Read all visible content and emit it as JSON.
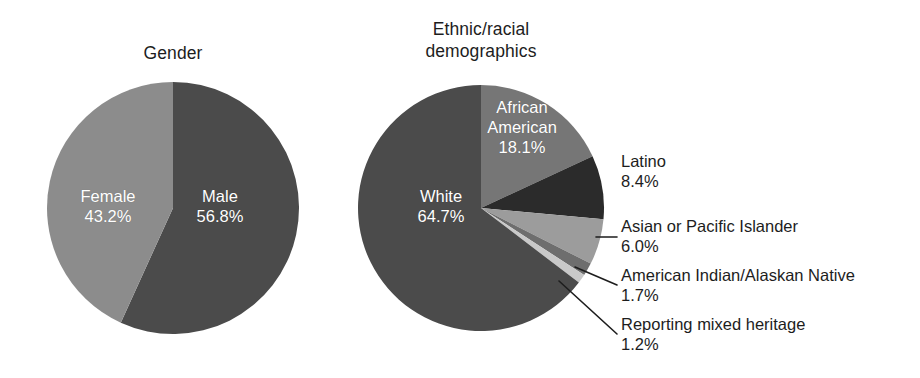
{
  "figure": {
    "background_color": "#ffffff",
    "text_color": "#1d1d1d",
    "inner_label_color": "#ffffff"
  },
  "charts": [
    {
      "id": "gender",
      "title": "Gender",
      "title_lines": "Gender"
    },
    {
      "id": "ethnic",
      "title": "Ethnic/racial demographics",
      "title_lines": "Ethnic/racial\ndemographics"
    }
  ],
  "labels": {
    "female_name": "Female",
    "female_value": "43.2%",
    "male_name": "Male",
    "male_value": "56.8%",
    "white_name": "White",
    "white_value": "64.7%",
    "african_american_name": "African American",
    "african_american_value": "18.1%",
    "latino_name": "Latino",
    "latino_value": "8.4%",
    "asian_name": "Asian or Pacific Islander",
    "asian_value": "6.0%",
    "american_indian_name": "American Indian/Alaskan Native",
    "american_indian_value": "1.7%",
    "mixed_name": "Reporting mixed heritage",
    "mixed_value": "1.2%"
  },
  "chart_data": [
    {
      "type": "pie",
      "title": "Gender",
      "xlabel": "",
      "ylabel": "",
      "legend": "none",
      "labels_position": "inside-slice",
      "start_angle_deg": 0,
      "direction": "clockwise",
      "categories": [
        "Male",
        "Female"
      ],
      "values": [
        56.8,
        43.2
      ],
      "value_labels": [
        "56.8%",
        "43.2%"
      ],
      "colors": [
        "#4b4b4b",
        "#8c8c8c"
      ],
      "units": "percent",
      "total": 100.0
    },
    {
      "type": "pie",
      "title": "Ethnic/racial demographics",
      "xlabel": "",
      "ylabel": "",
      "legend": "none",
      "labels_position": "inside-slice and outside with leader lines",
      "start_angle_deg": 0,
      "direction": "clockwise",
      "categories": [
        "African American",
        "Latino",
        "Asian or Pacific Islander",
        "American Indian/Alaskan Native",
        "Reporting mixed heritage",
        "White"
      ],
      "values": [
        18.1,
        8.4,
        6.0,
        1.7,
        1.2,
        64.7
      ],
      "value_labels": [
        "18.1%",
        "8.4%",
        "6.0%",
        "1.7%",
        "1.2%",
        "64.7%"
      ],
      "colors": [
        "#767676",
        "#2b2b2b",
        "#9c9c9c",
        "#6e6e6e",
        "#c9c9c9",
        "#4b4b4b"
      ],
      "units": "percent",
      "total": 100.1
    }
  ],
  "geometry": {
    "pie1": {
      "cx": 173,
      "cy": 208,
      "r": 126
    },
    "pie2": {
      "cx": 481,
      "cy": 208,
      "r": 123
    }
  }
}
